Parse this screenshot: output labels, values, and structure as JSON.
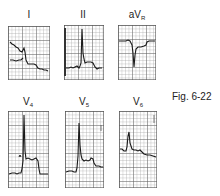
{
  "figure": {
    "caption": "Fig. 6-22",
    "grid_color": "#8a8a8a",
    "trace_color": "#1a1a1a",
    "leads": [
      {
        "id": "I",
        "label": "I",
        "sub": ""
      },
      {
        "id": "II",
        "label": "II",
        "sub": ""
      },
      {
        "id": "aVR",
        "label": "aV",
        "sub": "R"
      },
      {
        "id": "V4",
        "label": "V",
        "sub": "4"
      },
      {
        "id": "V5",
        "label": "V",
        "sub": "5"
      },
      {
        "id": "V6",
        "label": "V",
        "sub": "6"
      }
    ]
  }
}
